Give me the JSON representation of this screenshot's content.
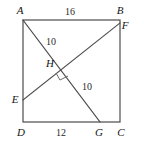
{
  "figure": {
    "background_color": "#ffffff",
    "line_color": "#4c4c4c",
    "label_color": "#141414"
  },
  "vertices": {
    "A": {
      "label": "A",
      "x": 23,
      "y": 20,
      "label_x": 20,
      "label_y": 14
    },
    "B": {
      "label": "B",
      "x": 120,
      "y": 20,
      "label_x": 120,
      "label_y": 14
    },
    "C": {
      "label": "C",
      "x": 120,
      "y": 122,
      "label_x": 121,
      "label_y": 136
    },
    "D": {
      "label": "D",
      "x": 23,
      "y": 122,
      "label_x": 21,
      "label_y": 136
    },
    "E": {
      "label": "E",
      "x": 23,
      "y": 100,
      "label_x": 15,
      "label_y": 103
    },
    "F": {
      "label": "F",
      "x": 120,
      "y": 23,
      "label_x": 125,
      "label_y": 29
    },
    "G": {
      "label": "G",
      "x": 100,
      "y": 122,
      "label_x": 99,
      "label_y": 136
    },
    "H": {
      "label": "H",
      "x": 64,
      "y": 69,
      "label_x": 50,
      "label_y": 67
    }
  },
  "segments": [
    {
      "name": "AG",
      "from": "A",
      "to": "G"
    },
    {
      "name": "EF",
      "from": "E",
      "to": "F"
    }
  ],
  "measures": [
    {
      "name": "AB",
      "value": "16",
      "x": 70,
      "y": 15
    },
    {
      "name": "AH",
      "value": "10",
      "x": 51,
      "y": 45
    },
    {
      "name": "HG",
      "value": "10",
      "x": 87,
      "y": 90
    },
    {
      "name": "DG",
      "value": "12",
      "x": 61,
      "y": 136
    }
  ],
  "markers": {
    "right_angle": {
      "name": "right-angle-mark",
      "at_vertex": "H",
      "points": "56,73 60,80 68,76"
    }
  }
}
